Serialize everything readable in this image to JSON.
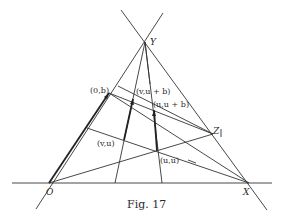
{
  "figure": {
    "caption": "Fig. 17",
    "points": {
      "O": {
        "label": "O",
        "x": 49,
        "y": 183
      },
      "X": {
        "label": "X",
        "x": 249,
        "y": 183
      },
      "Y": {
        "label": "Y",
        "x": 145,
        "y": 42
      },
      "Z": {
        "label": "Z",
        "x": 213,
        "y": 134
      }
    },
    "annotations": {
      "p0b": "(0,b)",
      "pvub": "(v,u + b)",
      "puub": "(u,u + b)",
      "pvu": "(v,u)",
      "puu": "(u,u)"
    },
    "colors": {
      "ink": "#222222",
      "background": "#ffffff"
    }
  }
}
